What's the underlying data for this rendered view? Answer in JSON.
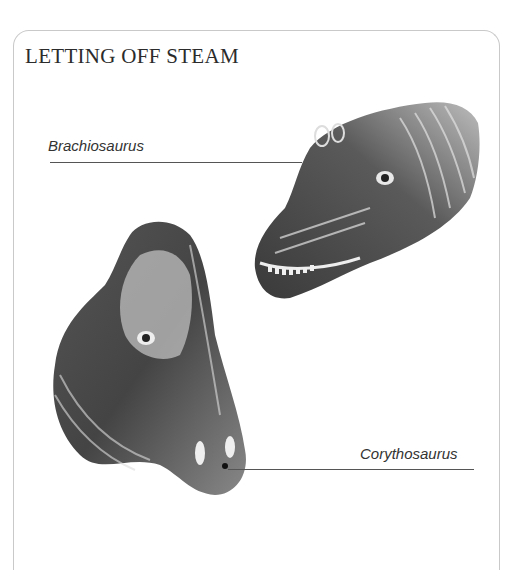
{
  "panel": {
    "title": "LETTING OFF STEAM"
  },
  "illustrations": [
    {
      "name": "Brachiosaurus",
      "label": "Brachiosaurus",
      "description": "pencil illustration of a Brachiosaurus head facing left with raised nasal openings"
    },
    {
      "name": "Corythosaurus",
      "label": "Corythosaurus",
      "description": "pencil illustration of a Corythosaurus head with a tall crest, facing down-right"
    }
  ],
  "colors": {
    "frame_border": "#c9c9c9",
    "text": "#2b2b2b",
    "leader_line": "#555555"
  }
}
